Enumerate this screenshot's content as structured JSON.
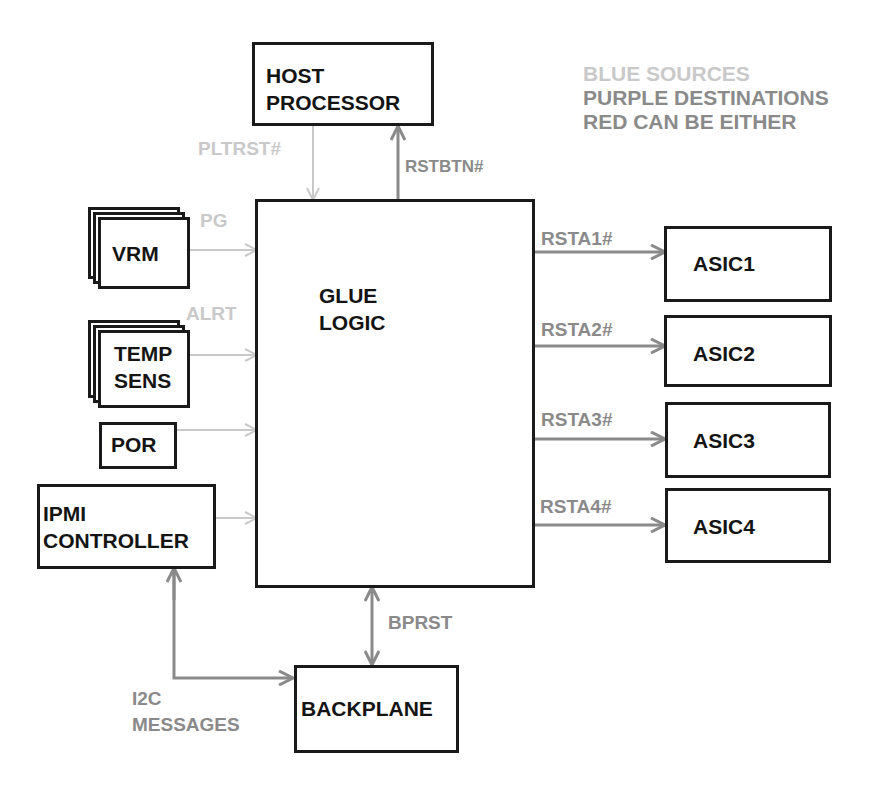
{
  "legend": {
    "line1": "BLUE SOURCES",
    "line2": "PURPLE DESTINATIONS",
    "line3": "RED CAN BE EITHER",
    "colors": {
      "sources": "#c9c9c9",
      "destinations": "#8a8a8a",
      "either": "#8a8a8a"
    }
  },
  "blocks": {
    "host": "HOST\nPROCESSOR",
    "glue": "GLUE\nLOGIC",
    "vrm": "VRM",
    "temp": "TEMP\nSENS",
    "por": "POR",
    "ipmi": "IPMI\nCONTROLLER",
    "asic1": "ASIC1",
    "asic2": "ASIC2",
    "asic3": "ASIC3",
    "asic4": "ASIC4",
    "backplane": "BACKPLANE"
  },
  "signals": {
    "pltrst": "PLTRST#",
    "rstbtn": "RSTBTN#",
    "pg": "PG",
    "alrt": "ALRT",
    "rsta1": "RSTA1#",
    "rsta2": "RSTA2#",
    "rsta3": "RSTA3#",
    "rsta4": "RSTA4#",
    "bprst": "BPRST",
    "i2c": "I2C\nMESSAGES"
  }
}
